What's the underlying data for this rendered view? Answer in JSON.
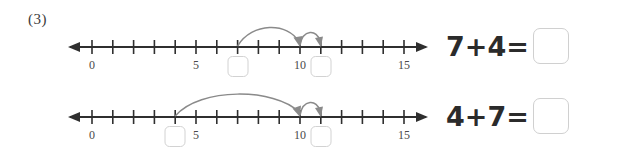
{
  "problem": {
    "number_label": "(3)"
  },
  "colors": {
    "axis": "#2f2f2f",
    "arc": "#8a8a8a",
    "box_border": "#d2d2d2",
    "text": "#2b2b2b",
    "tick_label": "#4a4a4a",
    "background": "#ffffff"
  },
  "numberline": {
    "min": 0,
    "max": 15,
    "tick_labels": [
      "0",
      "5",
      "10",
      "15"
    ],
    "tick_label_values": [
      0,
      5,
      10,
      15
    ],
    "left_arrow": true,
    "right_arrow": true
  },
  "rows": [
    {
      "id": "row-1",
      "equation": {
        "addend_1": "7",
        "addend_2": "4",
        "text": "7+4=",
        "answer": ""
      },
      "jumps": [
        {
          "name": "big-jump",
          "from": 7,
          "to": 10,
          "size": 3,
          "direction": "right"
        },
        {
          "name": "small-jump",
          "from": 10,
          "to": 11,
          "size": 1,
          "direction": "right"
        }
      ],
      "blank_boxes": [
        {
          "name": "start-blank",
          "at_value": 7,
          "value": ""
        },
        {
          "name": "end-blank",
          "at_value": 11,
          "value": ""
        }
      ]
    },
    {
      "id": "row-2",
      "equation": {
        "addend_1": "4",
        "addend_2": "7",
        "text": "4+7=",
        "answer": ""
      },
      "jumps": [
        {
          "name": "big-jump",
          "from": 4,
          "to": 10,
          "size": 6,
          "direction": "right"
        },
        {
          "name": "small-jump",
          "from": 10,
          "to": 11,
          "size": 1,
          "direction": "right"
        }
      ],
      "blank_boxes": [
        {
          "name": "start-blank",
          "at_value": 4,
          "value": ""
        },
        {
          "name": "end-blank",
          "at_value": 11,
          "value": ""
        }
      ]
    }
  ]
}
